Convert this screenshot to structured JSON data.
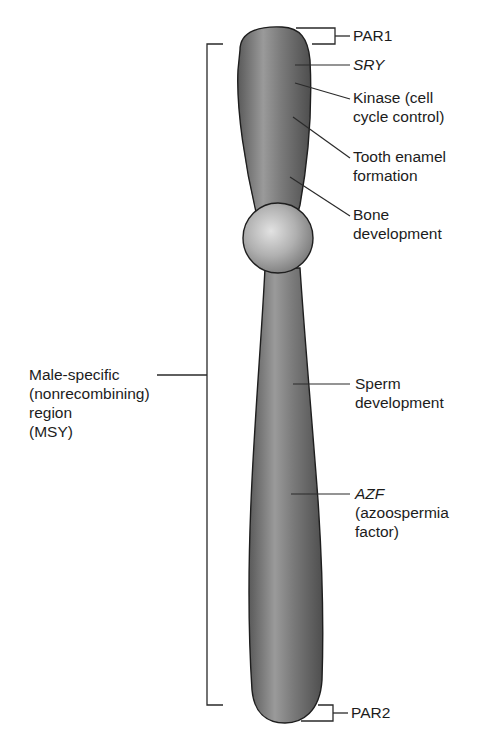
{
  "figure": {
    "colors": {
      "chromosome_fill": "#6e6e6e",
      "chromosome_highlight": "#b4b4b4",
      "outline": "#1e1e1e",
      "leader_line": "#2a2a2a",
      "text": "#1c1c1c",
      "background": "#ffffff"
    }
  },
  "labels": {
    "par1": {
      "lines": [
        "PAR1"
      ],
      "italic": false
    },
    "sry": {
      "lines": [
        "SRY"
      ],
      "italic": true
    },
    "kinase": {
      "lines": [
        "Kinase (cell",
        "cycle control)"
      ]
    },
    "tooth": {
      "lines": [
        "Tooth enamel",
        "formation"
      ]
    },
    "bone": {
      "lines": [
        "Bone",
        "development"
      ]
    },
    "msy": {
      "lines": [
        "Male-specific",
        "(nonrecombining)",
        "region",
        "(MSY)"
      ]
    },
    "sperm": {
      "lines": [
        "Sperm",
        "development"
      ]
    },
    "azf": {
      "lines": [
        "AZF",
        "(azoospermia",
        "factor)"
      ],
      "italic_first_line": true
    },
    "par2": {
      "lines": [
        "PAR2"
      ],
      "italic": false
    }
  }
}
